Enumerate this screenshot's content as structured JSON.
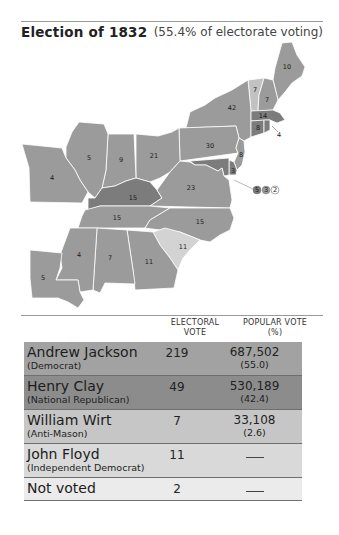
{
  "header": {
    "title": "Election of 1832",
    "subtitle": "(55.4% of electorate voting)"
  },
  "colors": {
    "jackson": "#9b9b9b",
    "clay": "#7c7c7c",
    "wirt": "#c2c2c2",
    "floyd": "#d3d3d3",
    "not_voted": "#ececec",
    "border": "#ffffff"
  },
  "map": {
    "states": [
      {
        "abbr": "ME",
        "votes": "10",
        "party": "jackson"
      },
      {
        "abbr": "VT",
        "votes": "7",
        "party": "wirt"
      },
      {
        "abbr": "NH",
        "votes": "7",
        "party": "jackson"
      },
      {
        "abbr": "NY",
        "votes": "42",
        "party": "jackson"
      },
      {
        "abbr": "MA",
        "votes": "14",
        "party": "clay"
      },
      {
        "abbr": "CT",
        "votes": "8",
        "party": "clay"
      },
      {
        "abbr": "RI",
        "votes": "4",
        "party": "clay"
      },
      {
        "abbr": "PA",
        "votes": "30",
        "party": "jackson"
      },
      {
        "abbr": "NJ",
        "votes": "8",
        "party": "jackson"
      },
      {
        "abbr": "DE",
        "votes": "3",
        "party": "clay"
      },
      {
        "abbr": "OH",
        "votes": "21",
        "party": "jackson"
      },
      {
        "abbr": "IN",
        "votes": "9",
        "party": "jackson"
      },
      {
        "abbr": "IL",
        "votes": "5",
        "party": "jackson"
      },
      {
        "abbr": "MO",
        "votes": "4",
        "party": "jackson"
      },
      {
        "abbr": "KY",
        "votes": "15",
        "party": "clay"
      },
      {
        "abbr": "VA",
        "votes": "23",
        "party": "jackson"
      },
      {
        "abbr": "TN",
        "votes": "15",
        "party": "jackson"
      },
      {
        "abbr": "NC",
        "votes": "15",
        "party": "jackson"
      },
      {
        "abbr": "SC",
        "votes": "11",
        "party": "floyd"
      },
      {
        "abbr": "GA",
        "votes": "11",
        "party": "jackson"
      },
      {
        "abbr": "AL",
        "votes": "7",
        "party": "jackson"
      },
      {
        "abbr": "MS",
        "votes": "4",
        "party": "jackson"
      },
      {
        "abbr": "LA",
        "votes": "5",
        "party": "jackson"
      }
    ],
    "maryland_split": [
      "5",
      "3",
      "2"
    ]
  },
  "table": {
    "headers": {
      "electoral_line1": "ELECTORAL",
      "electoral_line2": "VOTE",
      "popular_line1": "POPULAR VOTE",
      "popular_line2": "(%)"
    },
    "rows": [
      {
        "name": "Andrew Jackson",
        "party": "(Democrat)",
        "electoral": "219",
        "popular": "687,502",
        "percent": "(55.0)",
        "color": "#a2a2a2"
      },
      {
        "name": "Henry Clay",
        "party": "(National Republican)",
        "electoral": "49",
        "popular": "530,189",
        "percent": "(42.4)",
        "color": "#8c8c8c"
      },
      {
        "name": "William Wirt",
        "party": "(Anti-Mason)",
        "electoral": "7",
        "popular": "33,108",
        "percent": "(2.6)",
        "color": "#c6c6c6"
      },
      {
        "name": "John Floyd",
        "party": "(Independent Democrat)",
        "electoral": "11",
        "popular": "—",
        "percent": "",
        "color": "#d9d9d9"
      },
      {
        "name": "Not voted",
        "party": "",
        "electoral": "2",
        "popular": "—",
        "percent": "",
        "color": "#ebebeb"
      }
    ]
  }
}
